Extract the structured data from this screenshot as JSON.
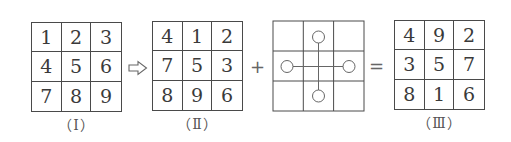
{
  "grid_I": {
    "label": "（Ⅰ）",
    "cells": [
      "1",
      "2",
      "3",
      "4",
      "5",
      "6",
      "7",
      "8",
      "9"
    ]
  },
  "grid_II": {
    "label": "（Ⅱ）",
    "cells": [
      "4",
      "1",
      "2",
      "7",
      "5",
      "3",
      "8",
      "9",
      "6"
    ]
  },
  "pattern_grid": {
    "description": "3x3 grid with four circles at edge-centers connected by a cross through the center",
    "circles": [
      "top",
      "left",
      "right",
      "bottom"
    ]
  },
  "grid_III": {
    "label": "（Ⅲ）",
    "cells": [
      "4",
      "9",
      "2",
      "3",
      "5",
      "7",
      "8",
      "1",
      "6"
    ]
  },
  "operators": {
    "arrow": "hollow-right-arrow-icon",
    "plus": "+",
    "equals": "="
  }
}
